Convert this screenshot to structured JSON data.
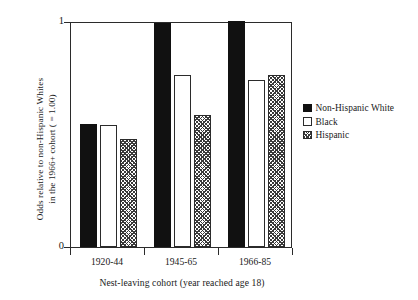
{
  "chart_data": {
    "type": "bar",
    "title": "",
    "xlabel": "Nest-leaving cohort (year reached age 18)",
    "ylabel_line1": "Odds relative to non-Hispanic Whites",
    "ylabel_line2": "in the 1966+ cohort ( = 1.00)",
    "categories": [
      "1920-44",
      "1945-65",
      "1966-85"
    ],
    "series": [
      {
        "name": "Non-Hispanic White",
        "swatch": "black",
        "values": [
          0.545,
          0.99,
          1.0
        ]
      },
      {
        "name": "Black",
        "swatch": "white",
        "values": [
          0.54,
          0.76,
          0.74
        ]
      },
      {
        "name": "Hispanic",
        "swatch": "hatch",
        "values": [
          0.48,
          0.585,
          0.76
        ]
      }
    ],
    "ylim": [
      0,
      1
    ],
    "yticks": [
      "0",
      "1"
    ],
    "ytick_values": [
      0,
      1
    ],
    "grid": false,
    "legend_position": "right"
  },
  "colors": {
    "axis": "#2b2b2b",
    "bar_black": "#111111",
    "bar_white": "#ffffff",
    "hatch_stroke": "#3a3a3a",
    "background": "#ffffff"
  }
}
